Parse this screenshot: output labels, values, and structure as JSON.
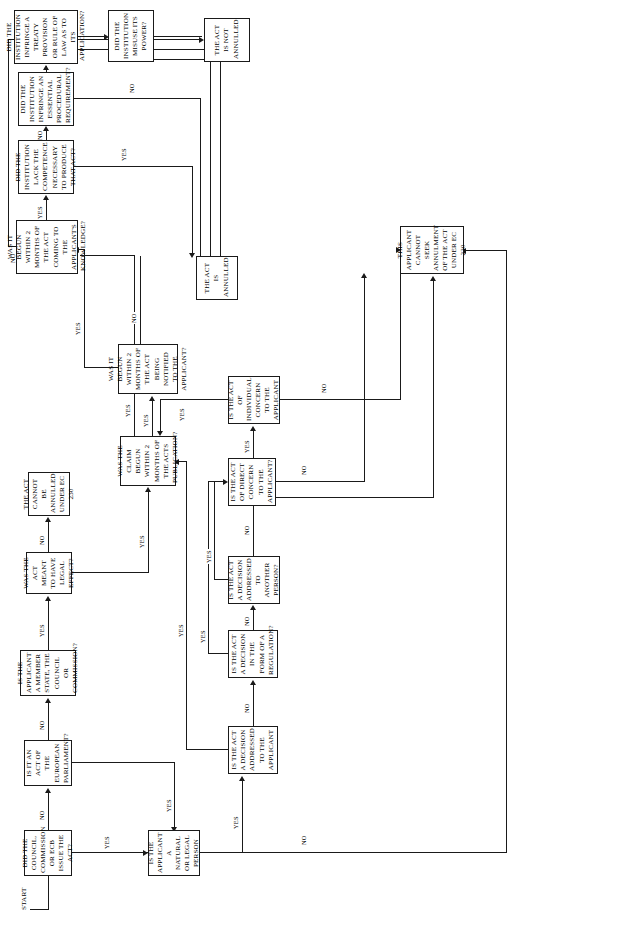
{
  "diagram": {
    "start_label": "START",
    "nodes": {
      "n1": "DID THE COUNCIL, COMMISSION OR ECB ISSUE THE ACT?",
      "n2": "IS IT AN ACT OF THE EUROPEAN PARLIAMENT?",
      "n3": "IS THE APPLICANT A MEMBER STATE, THE COUNCIL OR COMMISSION?",
      "n4": "IS THE APPLICANT A NATURAL OR LEGAL PERSON",
      "n5": "THE ACT CANNOT BE ANNULLED UNDER EC 230",
      "n6": "WAS THE ACT MEANT TO HAVE LEGAL EFFECT?",
      "n7": "WAS THE CLAIM BEGUN WITHIN 2 MONTHS OF THE ACTS PUBLICATION?",
      "n8": "WAS IT BEGUN WITHIN 2 MONTHS OF THE ACT BEING NOTIFIED TO THE APPLICANT?",
      "n9": "WAS IT BEGUN WITHIN 2 MONTHS OF THE ACT COMING TO THE APPLICANT'S KNOWLEDGE?",
      "n10": "DID THE INSTITUTION LACK THE COMPETENCE NECESSARY TO PRODUCE THAT ACT?",
      "n11": "DID THE INSTITUTION INFRINGE AN ESSENTIAL PROCEDURAL REQUIREMENT?",
      "n12": "DID THE INSTITUTION INFRINGE A TREATY PROVISION OR RULE OF LAW AS TO ITS APPLICATION?",
      "n13": "DID THE INSTITUTION MISUSE ITS POWER?",
      "n14": "THE ACT IS NOT ANNULLED",
      "n15": "THE ACT IS ANNULLED",
      "n16": "IS THE ACT A DECISION ADDRESSED TO THE APPLICANT",
      "n17": "IS THE ACT A DECISION IN THE FORM OF A REGULATION?",
      "n18": "IS THE ACT A DECISION ADDRESSED TO ANOTHER PERSON?",
      "n19": "IS THE ACT OF DIRECT CONCERN TO THE APPLICANT?",
      "n20": "IS THE ACT OF INDIVIDUAL CONCERN TO THE APPLICANT",
      "n21": "THIS APPLICANT CANNOT SEEK ANNULMENT OF THE ACT UNDER EC 230"
    },
    "edge_labels": {
      "e1": "NO",
      "e2": "YES",
      "e3": "NO",
      "e4": "YES",
      "e5": "YES",
      "e6": "NO",
      "e7": "YES",
      "e8": "YES",
      "e9": "NO",
      "e10": "YES",
      "e11": "NO",
      "e12": "YES",
      "e13": "NO",
      "e14": "YES",
      "e15": "NO",
      "e16": "YES",
      "e17": "NO",
      "e18": "YES",
      "e19": "NO",
      "e20": "YES",
      "e21": "YES",
      "e22": "NO",
      "e23": "YES",
      "e24": "NO",
      "e25": "YES",
      "e26": "NO",
      "e27": "YES",
      "e28": "NO"
    },
    "colors": {
      "stroke": "#1a1a1a",
      "fill": "#ffffff",
      "text": "#000000"
    }
  }
}
